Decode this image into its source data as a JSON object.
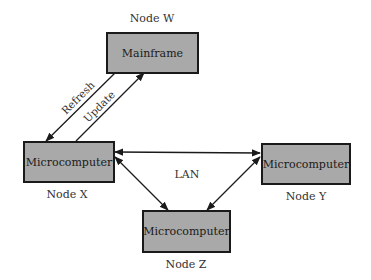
{
  "diagram": {
    "nodes": [
      {
        "id": "W",
        "label": "Node W",
        "box_text": "Mainframe"
      },
      {
        "id": "X",
        "label": "Node X",
        "box_text": "Microcomputer"
      },
      {
        "id": "Y",
        "label": "Node Y",
        "box_text": "Microcomputer"
      },
      {
        "id": "Z",
        "label": "Node Z",
        "box_text": "Microcomputer"
      }
    ],
    "edges": [
      {
        "from": "W",
        "to": "X",
        "label": "Refresh"
      },
      {
        "from": "X",
        "to": "W",
        "label": "Update"
      },
      {
        "from": "X",
        "to": "Y",
        "label": "",
        "bidirectional": true
      },
      {
        "from": "X",
        "to": "Z",
        "label": "",
        "bidirectional": true
      },
      {
        "from": "Y",
        "to": "Z",
        "label": "",
        "bidirectional": true
      }
    ],
    "network_label": "LAN",
    "colors": {
      "box_fill": "#a9a9a9",
      "box_border": "#1a1a1a",
      "line": "#1a1a1a"
    }
  }
}
